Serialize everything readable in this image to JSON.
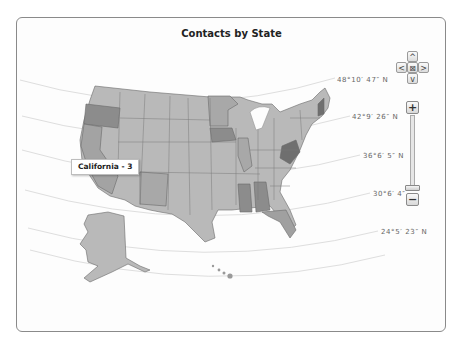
{
  "chart": {
    "title": "Contacts by State"
  },
  "latitude_labels": [
    {
      "text": "48°10′ 47″ N",
      "x": 337,
      "y": 79
    },
    {
      "text": "42°9′ 26″ N",
      "x": 352,
      "y": 116
    },
    {
      "text": "36°6′ 5″ N",
      "x": 363,
      "y": 155
    },
    {
      "text": "30°6′ 4″",
      "x": 373,
      "y": 193
    },
    {
      "text": "24°5′ 23″ N",
      "x": 381,
      "y": 231
    }
  ],
  "navigation": {
    "up": "^",
    "down": "v",
    "left": "<",
    "right": ">",
    "center": "⊠"
  },
  "zoom": {
    "in_label": "+",
    "out_label": "−"
  },
  "tooltip": {
    "text": "California - 3",
    "state": "California",
    "value": 3
  },
  "colors": {
    "base_state": "#b9b9b9",
    "mid_state": "#a3a3a3",
    "dark_state": "#8c8c8c",
    "darkest_state": "#6f6f6f",
    "state_border": "#6a6a6a",
    "frame_border": "#8a8a8a"
  },
  "highlighted_states": [
    {
      "name": "Oregon",
      "shade": "dark"
    },
    {
      "name": "Iowa",
      "shade": "dark"
    },
    {
      "name": "West Virginia",
      "shade": "darkest"
    },
    {
      "name": "New Hampshire",
      "shade": "darkest"
    },
    {
      "name": "Mississippi",
      "shade": "dark"
    },
    {
      "name": "Alabama",
      "shade": "dark"
    },
    {
      "name": "Florida",
      "shade": "mid"
    },
    {
      "name": "California",
      "shade": "mid"
    },
    {
      "name": "New Mexico",
      "shade": "mid"
    },
    {
      "name": "Illinois",
      "shade": "mid"
    },
    {
      "name": "Minnesota",
      "shade": "mid"
    }
  ]
}
